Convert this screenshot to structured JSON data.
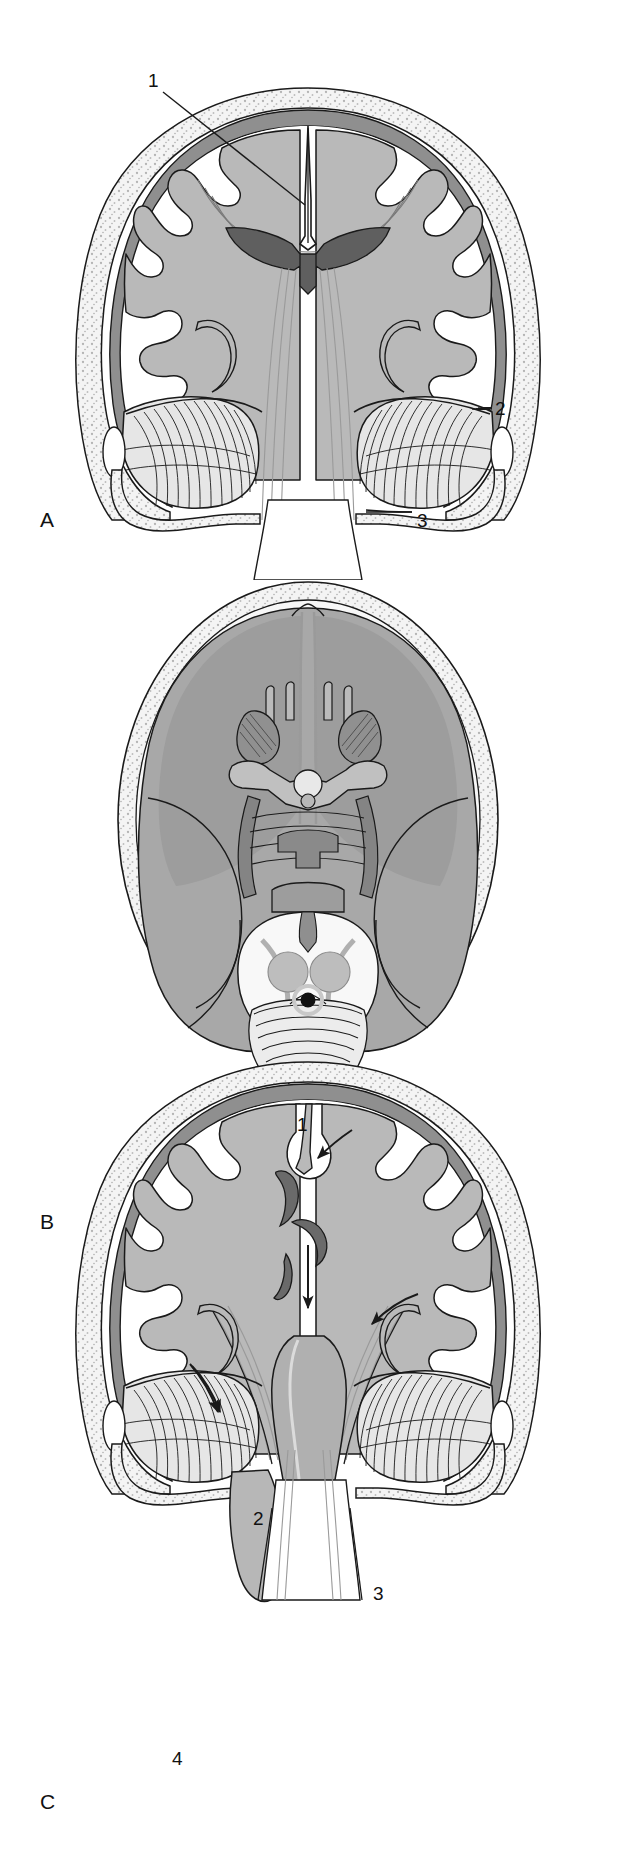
{
  "figure": {
    "type": "anatomical-illustration",
    "panels": [
      {
        "id": "A",
        "letter": "A",
        "view": "coronal-section-normal",
        "callouts": [
          {
            "number": "1",
            "leader": "line",
            "target": "midline-falx-cerebri"
          },
          {
            "number": "2",
            "leader": "line",
            "target": "tentorial-edge-right"
          },
          {
            "number": "3",
            "leader": "line",
            "target": "foramen-magnum-margin"
          }
        ]
      },
      {
        "id": "B",
        "letter": "B",
        "view": "axial-section-normal",
        "callouts": []
      },
      {
        "id": "C",
        "letter": "C",
        "view": "coronal-section-herniation",
        "callouts": [
          {
            "number": "1",
            "leader": "arrow",
            "target": "subfalcine-cingulate-herniation"
          },
          {
            "number": "2",
            "leader": "arrow",
            "target": "central-downward-herniation"
          },
          {
            "number": "3",
            "leader": "arrow",
            "target": "uncal-transtentorial-herniation"
          },
          {
            "number": "4",
            "leader": "arrow",
            "target": "tonsillar-herniation"
          }
        ]
      }
    ]
  },
  "colors": {
    "ink": "#1a1a1a",
    "white_matter": "#ffffff",
    "gray_matter": "#b9b9b9",
    "cortex_band": "#8f8f8f",
    "brain_fill_axial": "#a8a8a8",
    "brain_fill_axial_deep": "#979797",
    "skull_fill": "#f2f2f2",
    "skull_speckle": "#b0b0b0",
    "cerebellum_fill": "#e6e6e6",
    "dark_structure": "#666666",
    "background": "#ffffff"
  }
}
